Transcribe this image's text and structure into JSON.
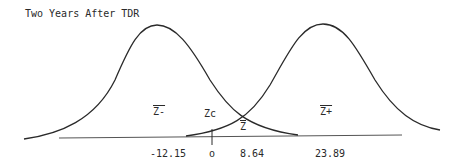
{
  "title": "Two Years After TDR",
  "labels": {
    "z_minus": "Z-",
    "z_c": "Zc",
    "z_bar": "Z",
    "z_plus": "Z+"
  },
  "ticks": {
    "minus": "-12.15",
    "zero": "o",
    "mid": "8.64",
    "plus": "23.89"
  },
  "colors": {
    "stroke": "#2a2a2a",
    "background": "#ffffff"
  }
}
